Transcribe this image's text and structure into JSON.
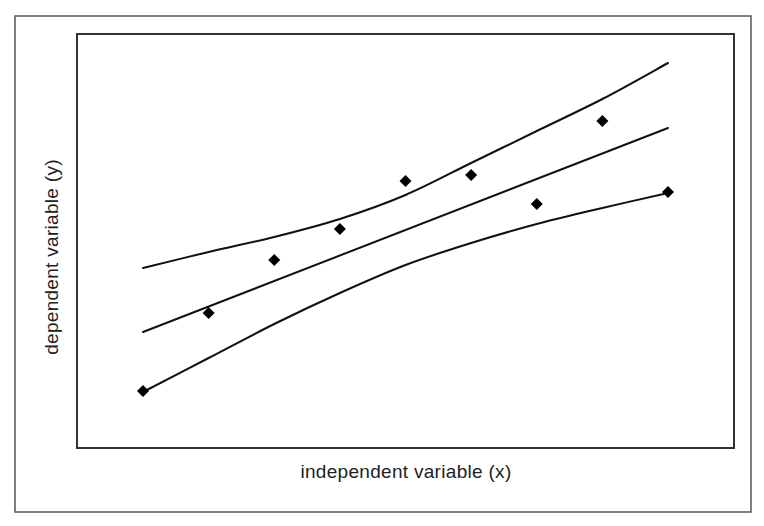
{
  "chart_data": {
    "type": "scatter",
    "title": "",
    "xlabel": "independent variable (x)",
    "ylabel": "dependent variable (y)",
    "grid": false,
    "legend": null,
    "ticks": "none shown",
    "xlim": [
      0,
      10
    ],
    "ylim": [
      0,
      414
    ],
    "points": {
      "name": "observations",
      "marker": "diamond",
      "x": [
        1,
        2,
        3,
        4,
        5,
        6,
        7,
        8,
        9
      ],
      "y": [
        57,
        135,
        188,
        219,
        267,
        273,
        244,
        327,
        256
      ]
    },
    "series": [
      {
        "name": "regression line",
        "type": "line",
        "x": [
          1,
          9
        ],
        "y": [
          116,
          320
        ]
      },
      {
        "name": "upper confidence band",
        "type": "line",
        "x": [
          1,
          2,
          3,
          4,
          5,
          6,
          7,
          8,
          9
        ],
        "y": [
          180,
          196,
          211,
          229,
          253,
          285,
          317,
          349,
          385
        ]
      },
      {
        "name": "lower confidence band",
        "type": "line",
        "x": [
          1,
          2,
          3,
          4,
          5,
          6,
          7,
          8,
          9
        ],
        "y": [
          56,
          90,
          124,
          155,
          183,
          205,
          224,
          240,
          255
        ]
      }
    ]
  },
  "labels": {
    "x_axis": "independent variable (x)",
    "y_axis": "dependent variable (y)"
  }
}
